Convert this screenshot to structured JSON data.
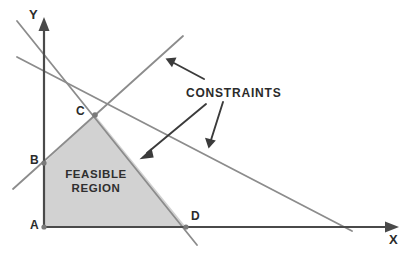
{
  "figure": {
    "kind": "linear-programming-feasible-region",
    "background_color": "#ffffff",
    "axis_color": "#4a4a4a",
    "constraint_line_color": "#8c8c8c",
    "region_fill_color": "#d2d2d2",
    "annotation_color": "#3b3b3b"
  },
  "axes": {
    "x_label": "X",
    "y_label": "Y",
    "origin_label": "A"
  },
  "vertices": [
    {
      "id": "A",
      "label": "A",
      "x": 44,
      "y": 227
    },
    {
      "id": "B",
      "label": "B",
      "x": 44,
      "y": 163
    },
    {
      "id": "C",
      "label": "C",
      "x": 95,
      "y": 115
    },
    {
      "id": "D",
      "label": "D",
      "x": 186,
      "y": 227
    }
  ],
  "region": {
    "label_line1": "FEASIBLE",
    "label_line2": "REGION",
    "polygon": "44,227 44,163 95,115 186,227"
  },
  "callout": {
    "label": "CONSTRAINTS",
    "pointer_count": 3
  },
  "constraint_lines": [
    {
      "id": "line-1",
      "x1": 17,
      "y1": 21,
      "x2": 197,
      "y2": 245
    },
    {
      "id": "line-2",
      "x1": 17,
      "y1": 57,
      "x2": 352,
      "y2": 231
    },
    {
      "id": "line-3",
      "x1": 13,
      "y1": 189,
      "x2": 183,
      "y2": 36
    }
  ],
  "pointers": [
    {
      "id": "pointer-1",
      "x1": 204,
      "y1": 79,
      "x2": 168,
      "y2": 60
    },
    {
      "id": "pointer-2",
      "x1": 206,
      "y1": 104,
      "x2": 141,
      "y2": 158
    },
    {
      "id": "pointer-3",
      "x1": 223,
      "y1": 102,
      "x2": 209,
      "y2": 147
    }
  ]
}
